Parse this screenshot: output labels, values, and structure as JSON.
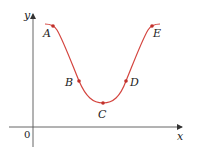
{
  "figure": {
    "type": "function-graph",
    "colors": {
      "axis": "#333333",
      "curve": "#d4453f",
      "point": "#c0302a"
    },
    "axes": {
      "x_label": "x",
      "y_label": "y",
      "origin_label": "0"
    },
    "points": [
      {
        "label": "A",
        "x": 53,
        "y": 26
      },
      {
        "label": "B",
        "x": 79,
        "y": 81
      },
      {
        "label": "C",
        "x": 103,
        "y": 103
      },
      {
        "label": "D",
        "x": 126,
        "y": 81
      },
      {
        "label": "E",
        "x": 152,
        "y": 26
      }
    ]
  }
}
